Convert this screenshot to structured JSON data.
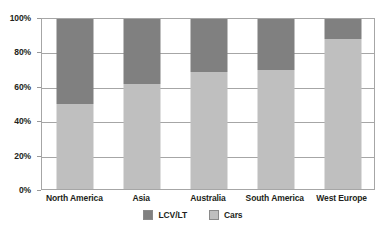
{
  "chart_data": {
    "type": "bar",
    "subtype": "stacked-100-percent",
    "title": "",
    "subtitle": "",
    "xlabel": "",
    "ylabel": "",
    "categories": [
      "North America",
      "Asia",
      "Australia",
      "South America",
      "West Europe"
    ],
    "series": [
      {
        "name": "LCV/LT",
        "color": "#808080",
        "values": [
          50,
          38,
          31,
          30,
          12
        ]
      },
      {
        "name": "Cars",
        "color": "#bfbfbf",
        "values": [
          50,
          62,
          69,
          70,
          88
        ]
      }
    ],
    "stack_order_bottom_to_top": [
      "Cars",
      "LCV/LT"
    ],
    "ylim": [
      0,
      100
    ],
    "y_ticks": [
      0,
      20,
      40,
      60,
      80,
      100
    ],
    "y_tick_labels": [
      "0%",
      "20%",
      "40%",
      "60%",
      "80%",
      "100%"
    ],
    "value_unit": "%",
    "grid": {
      "horizontal": true,
      "vertical": false,
      "color": "#a6a6a6"
    },
    "legend": {
      "position": "bottom",
      "entries": [
        "LCV/LT",
        "Cars"
      ]
    },
    "plot_border": true,
    "background_color": "#ffffff"
  },
  "axis": {
    "y_labels": [
      "100%",
      "80%",
      "60%",
      "40%",
      "20%",
      "0%"
    ],
    "x_labels": [
      "North America",
      "Asia",
      "Australia",
      "South America",
      "West Europe"
    ]
  },
  "legend": {
    "items": [
      {
        "label": "LCV/LT",
        "swatch": "legend-swatch-lcv"
      },
      {
        "label": "Cars",
        "swatch": "legend-swatch-cars"
      }
    ]
  }
}
